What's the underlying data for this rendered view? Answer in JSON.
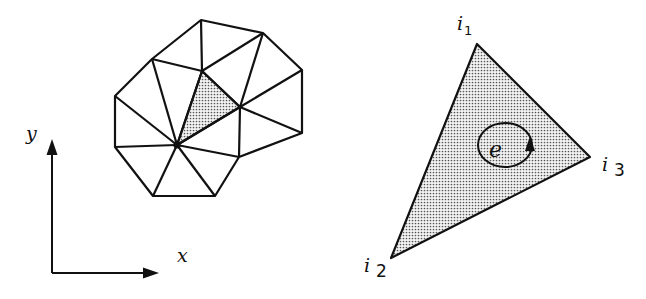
{
  "figure": {
    "colors": {
      "stroke": "#111111",
      "shade_dot": "#555555",
      "background": "#ffffff"
    }
  },
  "axes": {
    "x_label": "x",
    "y_label": "y"
  },
  "mesh": {
    "vertices": {
      "A": [
        201,
        20
      ],
      "B": [
        263,
        33
      ],
      "C": [
        302,
        70
      ],
      "D": [
        302,
        133
      ],
      "E": [
        239,
        157
      ],
      "F": [
        240,
        107
      ],
      "G": [
        202,
        71
      ],
      "H": [
        152,
        59
      ],
      "I": [
        115,
        96
      ],
      "J": [
        115,
        147
      ],
      "K": [
        177,
        145
      ],
      "L": [
        153,
        196
      ],
      "M": [
        215,
        196
      ]
    },
    "shaded_element": [
      "G",
      "F",
      "K"
    ]
  },
  "element": {
    "label": "e",
    "nodes": [
      {
        "name": "i",
        "sub": "1"
      },
      {
        "name": "i",
        "sub": "2"
      },
      {
        "name": "i",
        "sub": "3"
      }
    ],
    "orientation": "counter-clockwise"
  }
}
